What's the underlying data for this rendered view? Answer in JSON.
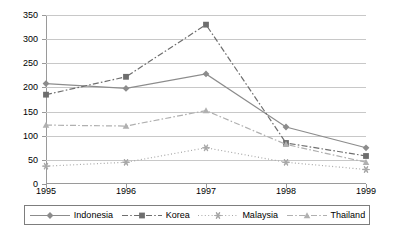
{
  "chart_data": {
    "type": "line",
    "title": "",
    "xlabel": "",
    "ylabel": "",
    "categories": [
      "1995",
      "1996",
      "1997",
      "1998",
      "1999"
    ],
    "ylim": [
      0,
      350
    ],
    "yticks": [
      "0",
      "50",
      "100",
      "150",
      "200",
      "250",
      "300",
      "350"
    ],
    "grid": true,
    "legend_position": "bottom",
    "series": [
      {
        "name": "Indonesia",
        "values": [
          208,
          198,
          228,
          118,
          75
        ],
        "marker": "diamond",
        "line_style": "solid",
        "color": "#8c8c8c"
      },
      {
        "name": "Korea",
        "values": [
          185,
          222,
          330,
          85,
          58
        ],
        "marker": "square",
        "line_style": "dash-dot",
        "color": "#6e6e6e"
      },
      {
        "name": "Malaysia",
        "values": [
          37,
          45,
          75,
          45,
          30
        ],
        "marker": "asterisk",
        "line_style": "dotted",
        "color": "#a8a8a8"
      },
      {
        "name": "Thailand",
        "values": [
          122,
          120,
          152,
          82,
          45
        ],
        "marker": "triangle",
        "line_style": "dash-dot",
        "color": "#b0b0b0"
      }
    ]
  },
  "legend": {
    "items": [
      {
        "label": "Indonesia"
      },
      {
        "label": "Korea"
      },
      {
        "label": "Malaysia"
      },
      {
        "label": "Thailand"
      }
    ]
  },
  "colors": {
    "axis": "#9a9a9a",
    "grid": "#c8c8c8",
    "legend_border": "#7d7d7d",
    "text": "#000000",
    "background": "#ffffff"
  }
}
